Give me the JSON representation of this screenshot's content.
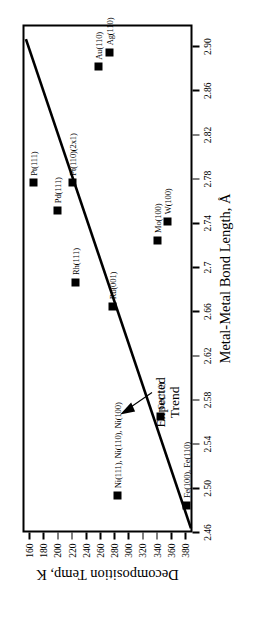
{
  "chart_data": {
    "type": "scatter",
    "title": "",
    "xlabel": "Metal-Metal Bond Length, Å",
    "ylabel": "Decomposition Temp, K",
    "xlim": [
      2.46,
      2.92
    ],
    "ylim": [
      150,
      390
    ],
    "xticks": [
      "2.46",
      "2.50",
      "2.54",
      "2.58",
      "2.62",
      "2.66",
      "2.7",
      "2.74",
      "2.78",
      "2.82",
      "2.86",
      "2.90"
    ],
    "xtick_values": [
      2.46,
      2.5,
      2.54,
      2.58,
      2.62,
      2.66,
      2.7,
      2.74,
      2.78,
      2.82,
      2.86,
      2.9
    ],
    "yticks": [
      "160",
      "180",
      "200",
      "220",
      "240",
      "260",
      "280",
      "300",
      "320",
      "340",
      "360",
      "380"
    ],
    "ytick_values": [
      160,
      180,
      200,
      220,
      240,
      260,
      280,
      300,
      320,
      340,
      360,
      380
    ],
    "grid": false,
    "legend": "none",
    "y_axis_inverted_in_display": true,
    "rotation_deg": -90,
    "points": [
      {
        "label": "Pt(111)",
        "x": 2.775,
        "y": 163
      },
      {
        "label": "Pd(111)",
        "x": 2.75,
        "y": 196
      },
      {
        "label": "Pt(110)(2x1)",
        "x": 2.775,
        "y": 218
      },
      {
        "label": "Au(110)",
        "x": 2.88,
        "y": 255
      },
      {
        "label": "Ag(110)",
        "x": 2.893,
        "y": 270
      },
      {
        "label": "Rh(111)",
        "x": 2.685,
        "y": 222
      },
      {
        "label": "Ru(001)",
        "x": 2.663,
        "y": 274
      },
      {
        "label": "Mo(100)",
        "x": 2.723,
        "y": 338
      },
      {
        "label": "W(100)",
        "x": 2.74,
        "y": 352
      },
      {
        "label": "Ni(111), Ni(110), Ni(100)",
        "x": 2.492,
        "y": 281
      },
      {
        "label": "Cu(110)",
        "x": 2.563,
        "y": 342
      },
      {
        "label": "Fe(100), Fe(110)",
        "x": 2.483,
        "y": 378
      }
    ],
    "trend_line": {
      "label": "Expected Trend",
      "x_start": 2.462,
      "y_start": 385,
      "x_end": 2.905,
      "y_end": 152,
      "annotation": "Expected Trend",
      "has_arrow": true
    },
    "marker_color": "#000000",
    "line_color": "#000000",
    "background_color": "#ffffff"
  }
}
